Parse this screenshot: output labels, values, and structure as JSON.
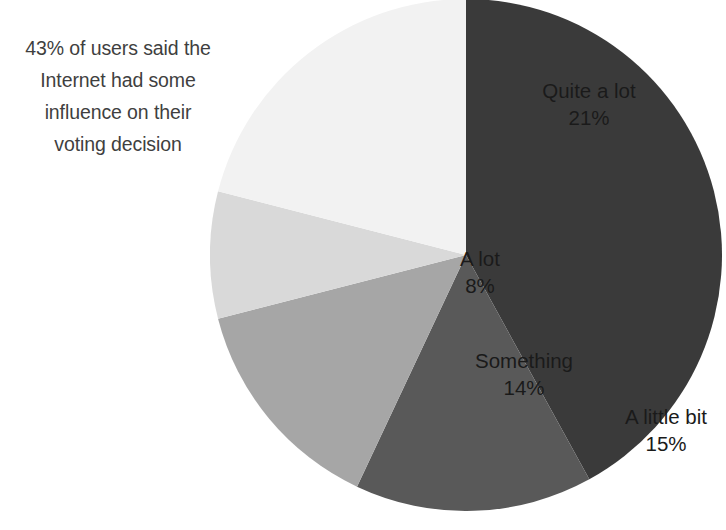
{
  "annotation": {
    "lines": [
      "43% of users said the",
      "Internet had some",
      "influence on their",
      "voting decision"
    ]
  },
  "chart_data": {
    "type": "pie",
    "title": "",
    "subtitle": "",
    "xlabel": "",
    "ylabel": "",
    "grid": false,
    "legend_position": "none",
    "label_mode": "inside-slice-name-and-percent",
    "start_angle_deg": 0,
    "direction": "clockwise",
    "units": "percent",
    "total": 100,
    "annotation_text": "43% of users said the Internet had some influence on their voting decision",
    "categories": [
      "Nothing",
      "A little bit",
      "Something",
      "A lot",
      "Quite a lot"
    ],
    "values": [
      42,
      15,
      14,
      8,
      21
    ],
    "colors": [
      "#3a3a3a",
      "#595959",
      "#a6a6a6",
      "#d9d9d9",
      "#f2f2f2"
    ],
    "slices": [
      {
        "name": "Nothing",
        "value": 42,
        "percent_label": "42%",
        "color": "#3a3a3a",
        "text_color": "#ffffff"
      },
      {
        "name": "A little bit",
        "value": 15,
        "percent_label": "15%",
        "color": "#595959",
        "text_color": "#1a1a1a"
      },
      {
        "name": "Something",
        "value": 14,
        "percent_label": "14%",
        "color": "#a6a6a6",
        "text_color": "#1a1a1a"
      },
      {
        "name": "A lot",
        "value": 8,
        "percent_label": "8%",
        "color": "#d9d9d9",
        "text_color": "#1a1a1a"
      },
      {
        "name": "Quite a lot",
        "value": 21,
        "percent_label": "21%",
        "color": "#f2f2f2",
        "text_color": "#1a1a1a"
      }
    ]
  }
}
